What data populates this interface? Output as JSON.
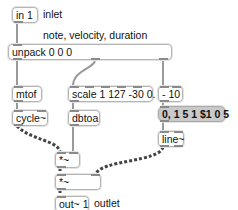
{
  "patcher": {
    "objects": {
      "in1": "in 1",
      "unpack": "unpack 0 0 0",
      "mtof": "mtof",
      "cycle": "cycle~",
      "scale": "scale 1 127 -30 0.",
      "dbtoa": "dbtoa",
      "minus10": "- 10",
      "message": "0, 1 5 1 $1 0 5",
      "line": "line~",
      "mult1": "*~",
      "mult2": "*~",
      "out1": "out~ 1"
    },
    "comments": {
      "inlet": "inlet",
      "note_velocity_duration": "note, velocity, duration",
      "outlet": "outlet"
    },
    "colors": {
      "box_border": "#b5b5b5",
      "message_bg": "#c9c9c9",
      "cord_control": "#8a8a8a",
      "cord_signal": "#555555"
    }
  }
}
